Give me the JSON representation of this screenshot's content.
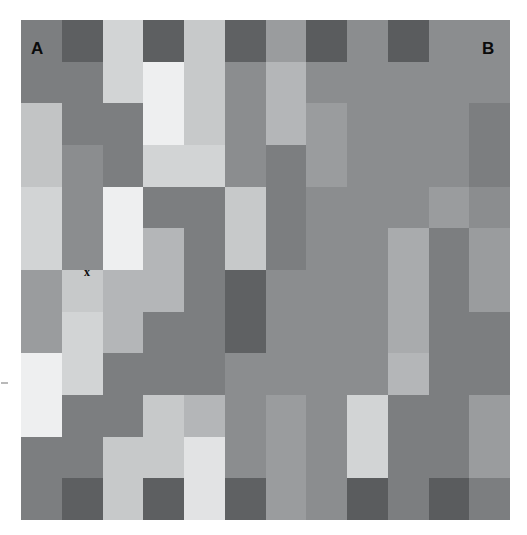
{
  "figure": {
    "title": "",
    "type": "grayscale-mosaic",
    "background_color": "#ffffff",
    "grid": {
      "columns": 12,
      "rows": 12,
      "origin_x_px": 21,
      "origin_y_px": 20,
      "width_px": 489,
      "height_px": 500,
      "cell_width_px": 40.75,
      "cell_height_px": 41.67
    },
    "labels": [
      {
        "name": "label-a",
        "text": "A",
        "x_px": 31,
        "y_px": 40,
        "size": "big",
        "color": "#0b0b0b"
      },
      {
        "name": "label-b",
        "text": "B",
        "x_px": 482,
        "y_px": 40,
        "size": "big",
        "color": "#0b0b0b"
      },
      {
        "name": "label-x",
        "text": "x",
        "x_px": 84,
        "y_px": 266,
        "size": "small",
        "color": "#0b0b0b"
      }
    ],
    "palette": {
      "darkest": "#555658",
      "dark": "#5f6163",
      "mid_dark": "#6f7173",
      "mid": "#7c7e80",
      "mid_light": "#8b8d8f",
      "light": "#9a9c9e",
      "lighter": "#adafb1",
      "pale": "#c2c4c5",
      "paler": "#d2d4d5",
      "near_white": "#e2e3e4",
      "white_ish": "#eeeff0"
    },
    "cells": [
      [
        "#7c7e80",
        "#5d5f61",
        "#d2d4d5",
        "#5d5f61",
        "#c7c9ca",
        "#5f6163",
        "#9a9c9e",
        "#5a5c5e",
        "#8b8d8f",
        "#5a5c5e",
        "#8b8d8f",
        "#8b8d8f"
      ],
      [
        "#7c7e80",
        "#7c7e80",
        "#d2d4d5",
        "#eeeff0",
        "#c7c9ca",
        "#8b8d8f",
        "#b4b6b8",
        "#8b8d8f",
        "#8b8d8f",
        "#8b8d8f",
        "#8b8d8f",
        "#8b8d8f"
      ],
      [
        "#c2c4c5",
        "#7c7e80",
        "#7c7e80",
        "#eeeff0",
        "#c7c9ca",
        "#8b8d8f",
        "#b4b6b8",
        "#9a9c9e",
        "#8b8d8f",
        "#8b8d8f",
        "#8b8d8f",
        "#7c7e80"
      ],
      [
        "#c2c4c5",
        "#8b8d8f",
        "#7c7e80",
        "#d2d4d5",
        "#d2d4d5",
        "#8b8d8f",
        "#7c7e80",
        "#9a9c9e",
        "#8b8d8f",
        "#8b8d8f",
        "#8b8d8f",
        "#7c7e80"
      ],
      [
        "#d2d4d5",
        "#8b8d8f",
        "#eeeff0",
        "#7c7e80",
        "#7c7e80",
        "#c7c9ca",
        "#7c7e80",
        "#8b8d8f",
        "#8b8d8f",
        "#8b8d8f",
        "#9a9c9e",
        "#8b8d8f"
      ],
      [
        "#d2d4d5",
        "#8b8d8f",
        "#eeeff0",
        "#b4b6b8",
        "#7c7e80",
        "#c7c9ca",
        "#7c7e80",
        "#8b8d8f",
        "#8b8d8f",
        "#a9abad",
        "#7c7e80",
        "#9a9c9e"
      ],
      [
        "#9a9c9e",
        "#c7c9ca",
        "#b4b6b8",
        "#b4b6b8",
        "#7c7e80",
        "#5f6163",
        "#8b8d8f",
        "#8b8d8f",
        "#8b8d8f",
        "#a9abad",
        "#7c7e80",
        "#9a9c9e"
      ],
      [
        "#9a9c9e",
        "#d2d4d5",
        "#b4b6b8",
        "#7c7e80",
        "#7c7e80",
        "#5f6163",
        "#8b8d8f",
        "#8b8d8f",
        "#8b8d8f",
        "#a9abad",
        "#7c7e80",
        "#7c7e80"
      ],
      [
        "#eeeff0",
        "#d2d4d5",
        "#7c7e80",
        "#7c7e80",
        "#7c7e80",
        "#8b8d8f",
        "#8b8d8f",
        "#8b8d8f",
        "#8b8d8f",
        "#b4b6b8",
        "#7c7e80",
        "#7c7e80"
      ],
      [
        "#eeeff0",
        "#7c7e80",
        "#7c7e80",
        "#c7c9ca",
        "#b4b6b8",
        "#8b8d8f",
        "#9a9c9e",
        "#8b8d8f",
        "#d2d4d5",
        "#7c7e80",
        "#7c7e80",
        "#9a9c9e"
      ],
      [
        "#7c7e80",
        "#7c7e80",
        "#c7c9ca",
        "#c7c9ca",
        "#e2e3e4",
        "#8b8d8f",
        "#9a9c9e",
        "#8b8d8f",
        "#d2d4d5",
        "#7c7e80",
        "#7c7e80",
        "#9a9c9e"
      ],
      [
        "#7c7e80",
        "#5d5f61",
        "#c7c9ca",
        "#5d5f61",
        "#e2e3e4",
        "#5f6163",
        "#9a9c9e",
        "#8b8d8f",
        "#5a5c5e",
        "#7c7e80",
        "#5a5c5e",
        "#7c7e80"
      ]
    ]
  },
  "chart_data": {
    "type": "heatmap",
    "title": "",
    "xlabel": "",
    "ylabel": "",
    "grid": false,
    "legend": "none",
    "nrows": 12,
    "ncols": 12,
    "value_scale": "grayscale luminance 0-255",
    "annotations": [
      {
        "text": "A",
        "col": 1,
        "row": 1,
        "note": "test patch label, upper-left"
      },
      {
        "text": "B",
        "col": 12,
        "row": 1,
        "note": "test patch label, upper-right"
      },
      {
        "text": "x",
        "col": 2,
        "row": 7,
        "note": "small marker in light patch"
      }
    ],
    "luminance": [
      [
        124,
        93,
        210,
        93,
        199,
        95,
        154,
        90,
        139,
        90,
        139,
        139
      ],
      [
        124,
        124,
        210,
        239,
        199,
        139,
        180,
        139,
        139,
        139,
        139,
        139
      ],
      [
        194,
        124,
        124,
        239,
        199,
        139,
        180,
        154,
        139,
        139,
        139,
        124
      ],
      [
        194,
        139,
        124,
        210,
        210,
        139,
        124,
        154,
        139,
        139,
        139,
        124
      ],
      [
        210,
        139,
        239,
        124,
        124,
        199,
        124,
        139,
        139,
        139,
        154,
        139
      ],
      [
        210,
        139,
        239,
        180,
        124,
        199,
        124,
        139,
        139,
        169,
        124,
        154
      ],
      [
        154,
        199,
        180,
        180,
        124,
        95,
        139,
        139,
        139,
        169,
        124,
        154
      ],
      [
        154,
        210,
        180,
        124,
        124,
        95,
        139,
        139,
        139,
        169,
        124,
        124
      ],
      [
        239,
        210,
        124,
        124,
        124,
        139,
        139,
        139,
        139,
        180,
        124,
        124
      ],
      [
        239,
        124,
        124,
        199,
        180,
        139,
        154,
        139,
        210,
        124,
        124,
        154
      ],
      [
        124,
        124,
        199,
        199,
        226,
        139,
        154,
        139,
        210,
        124,
        124,
        154
      ],
      [
        124,
        93,
        199,
        93,
        226,
        95,
        154,
        139,
        90,
        124,
        90,
        124
      ]
    ]
  },
  "left_tick": {
    "name": "left-margin-tick",
    "color": "#b9b9b9"
  }
}
